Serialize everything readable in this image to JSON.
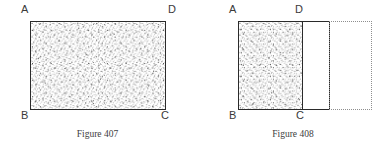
{
  "page": {
    "background_color": "#ffffff",
    "width": 391,
    "height": 154
  },
  "figures": [
    {
      "id": "figure-407",
      "caption": "Figure 407",
      "description": "A single stippled (shaded) rectangle labelled A D across the top and B C across the bottom.",
      "vertex_labels": {
        "top_left": "A",
        "top_right": "D",
        "bottom_left": "B",
        "bottom_right": "C"
      },
      "shapes": [
        {
          "name": "shaded-rectangle",
          "fill": "stipple",
          "stroke": "#2a2a2a",
          "style": "solid"
        }
      ]
    },
    {
      "id": "figure-408",
      "caption": "Figure 408",
      "description": "A stippled rectangle A B C D adjoined on the right by an empty solid-outlined rectangle, which is itself continued by a dotted outlined rectangle.",
      "vertex_labels": {
        "top_left": "A",
        "top_right": "D",
        "bottom_left": "B",
        "bottom_right": "C"
      },
      "shapes": [
        {
          "name": "shaded-rectangle",
          "fill": "stipple",
          "stroke": "#2a2a2a",
          "style": "solid"
        },
        {
          "name": "empty-rectangle",
          "fill": "none",
          "stroke": "#2a2a2a",
          "style": "solid"
        },
        {
          "name": "dotted-extension-rectangle",
          "fill": "none",
          "stroke": "#8e8e8e",
          "style": "dotted"
        }
      ]
    }
  ],
  "colors": {
    "ink": "#2a2a2a",
    "label_ink": "#3a3a3a",
    "caption_ink": "#3d3d3d",
    "dotted_ink": "#8e8e8e",
    "stipple_ink": "#6f6f6f",
    "paper": "#ffffff"
  }
}
